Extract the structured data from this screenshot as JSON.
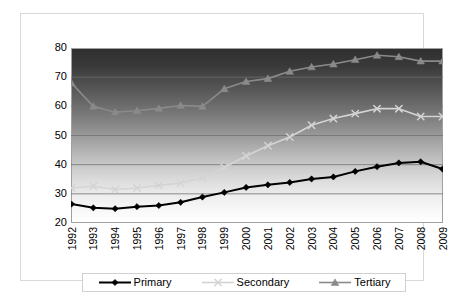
{
  "chart_data": {
    "type": "line",
    "title": "",
    "subtitle": "",
    "xlabel": "",
    "ylabel": "",
    "x": [
      1992,
      1993,
      1994,
      1995,
      1996,
      1997,
      1998,
      1999,
      2000,
      2001,
      2002,
      2003,
      2004,
      2005,
      2006,
      2007,
      2008,
      2009
    ],
    "categories": [
      "1992",
      "1993",
      "1994",
      "1995",
      "1996",
      "1997",
      "1998",
      "1999",
      "2000",
      "2001",
      "2002",
      "2003",
      "2004",
      "2005",
      "2006",
      "2007",
      "2008",
      "2009"
    ],
    "xlim": [
      1992,
      2009
    ],
    "ylim": [
      20,
      80
    ],
    "y_ticks": [
      20,
      30,
      40,
      50,
      60,
      70,
      80
    ],
    "y_tick_labels": [
      "20",
      "30",
      "40",
      "50",
      "60",
      "70",
      "80"
    ],
    "grid": true,
    "grid_axis": "y",
    "legend_position": "bottom",
    "background": "vertical-gradient-dark-to-light",
    "series": [
      {
        "name": "Primary",
        "color": "#000000",
        "marker": "diamond",
        "values": [
          26.5,
          25.2,
          24.9,
          25.6,
          26.0,
          27.1,
          28.9,
          30.5,
          32.2,
          33.1,
          33.9,
          35.1,
          35.8,
          37.7,
          39.3,
          40.6,
          41.0,
          38.5
        ]
      },
      {
        "name": "Secondary",
        "color": "#d4d4d4",
        "marker": "x-star",
        "values": [
          32.0,
          32.6,
          31.5,
          32.0,
          32.9,
          33.7,
          35.5,
          39.0,
          43.0,
          46.5,
          49.5,
          53.5,
          55.8,
          57.5,
          59.2,
          59.2,
          56.5,
          56.5
        ]
      },
      {
        "name": "Tertiary",
        "color": "#8a8a8a",
        "marker": "triangle",
        "values": [
          68.0,
          60.0,
          58.0,
          58.5,
          59.3,
          60.3,
          60.0,
          66.0,
          68.5,
          69.5,
          72.0,
          73.5,
          74.5,
          76.0,
          77.5,
          77.0,
          75.5,
          75.5
        ]
      }
    ]
  },
  "legend": {
    "entries": [
      {
        "label": "Primary"
      },
      {
        "label": "Secondary"
      },
      {
        "label": "Tertiary"
      }
    ]
  },
  "colors": {
    "primary": "#000000",
    "secondary": "#d4d4d4",
    "tertiary": "#8a8a8a",
    "gridline": "#707070",
    "frame_border": "#d9d9d9",
    "plot_border": "#a0a0a0"
  }
}
